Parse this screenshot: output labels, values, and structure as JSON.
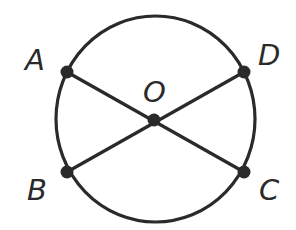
{
  "diagram": {
    "type": "geometry-circle",
    "colors": {
      "stroke": "#2a2a2a",
      "point": "#2a2a2a",
      "background": "#ffffff"
    },
    "circle": {
      "center": "O",
      "cx": 155,
      "cy": 119,
      "r": 101
    },
    "points": {
      "A": {
        "label": "A",
        "x": 67,
        "y": 72
      },
      "B": {
        "label": "B",
        "x": 67,
        "y": 172
      },
      "C": {
        "label": "C",
        "x": 244,
        "y": 172
      },
      "D": {
        "label": "D",
        "x": 244,
        "y": 72
      },
      "O": {
        "label": "O",
        "x": 154,
        "y": 120
      }
    },
    "segments": [
      {
        "from": "A",
        "to": "C"
      },
      {
        "from": "D",
        "to": "B"
      }
    ],
    "labels": {
      "A": "A",
      "B": "B",
      "C": "C",
      "D": "D",
      "O": "O"
    }
  }
}
